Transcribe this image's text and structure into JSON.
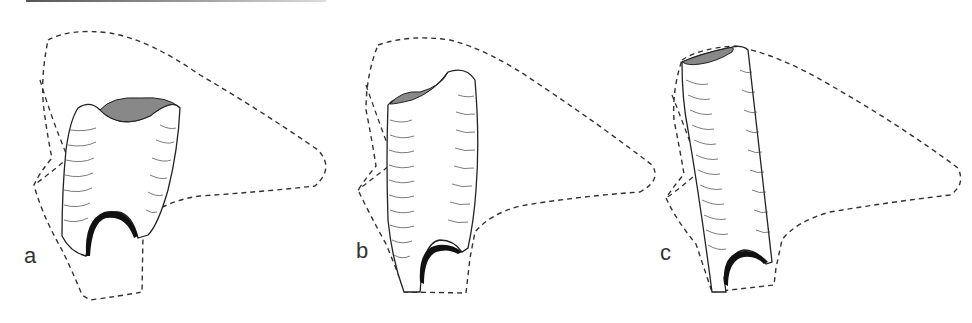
{
  "figure": {
    "panels": [
      {
        "label": "a",
        "x": 0
      },
      {
        "label": "b",
        "x": 330
      },
      {
        "label": "c",
        "x": 660
      }
    ],
    "colors": {
      "line": "#222222",
      "dashed_outline": "#333333",
      "fill_black": "#111111",
      "background": "#ffffff"
    }
  }
}
